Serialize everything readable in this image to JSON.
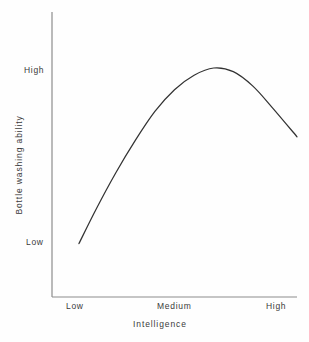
{
  "chart_data": {
    "type": "line",
    "title": "",
    "subtitle": "",
    "xlabel": "Intelligence",
    "ylabel": "Bottle washing ability",
    "x_tick_labels": [
      "Low",
      "Medium",
      "High"
    ],
    "y_tick_labels": [
      "Low",
      "High"
    ],
    "xlim": [
      0,
      1
    ],
    "ylim": [
      0,
      1
    ],
    "grid": false,
    "legend": null,
    "annotations": [],
    "series": [
      {
        "name": "Bottle washing ability vs Intelligence",
        "x": [
          0.11,
          0.18,
          0.26,
          0.34,
          0.42,
          0.5,
          0.58,
          0.66,
          0.74,
          0.82,
          0.9,
          1.0
        ],
        "values": [
          0.03,
          0.22,
          0.42,
          0.6,
          0.76,
          0.88,
          0.96,
          1.0,
          0.98,
          0.9,
          0.78,
          0.62
        ],
        "color": "#333333"
      }
    ]
  },
  "axes": {
    "y_tick_high": "High",
    "y_tick_low": "Low",
    "x_tick_low": "Low",
    "x_tick_medium": "Medium",
    "x_tick_high": "High",
    "x_title": "Intelligence",
    "y_title": "Bottle washing ability"
  },
  "style": {
    "line_color": "#333333",
    "axis_color": "#8c8c8c",
    "text_color": "#3a3a3a",
    "background": "#fefefe"
  }
}
